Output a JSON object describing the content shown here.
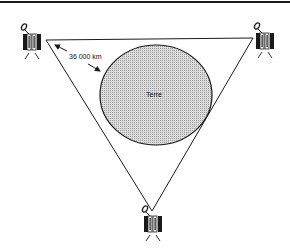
{
  "diagram": {
    "earth_label": "Terre",
    "distance_label": "36 000 km",
    "colors": {
      "line": "#1a1a1a",
      "earth_fill": "#cfcfcf",
      "background": "#ffffff"
    },
    "satellites": [
      {
        "position": "top-left"
      },
      {
        "position": "top-right"
      },
      {
        "position": "bottom"
      }
    ]
  }
}
